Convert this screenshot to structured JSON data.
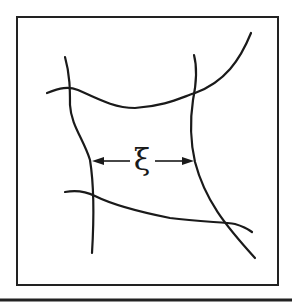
{
  "diagram": {
    "label": "ξ",
    "label_meaning": "correlation length / mesh size",
    "arrow_type": "double-headed dimension arrow",
    "strand_count": 4,
    "colors": {
      "background": "#ffffff",
      "ink": "#1a1a1a"
    }
  }
}
